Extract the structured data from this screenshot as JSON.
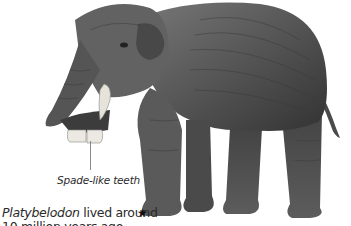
{
  "illustration": {
    "subject": "Platybelodon",
    "body_color": "#5a5a5a",
    "shadow_color": "#2e2e2e",
    "tooth_color": "#e8e6df",
    "background": "#ffffff"
  },
  "labels": {
    "teeth": "Spade-like teeth"
  },
  "caption": {
    "name": "Platybelodon",
    "line1_rest": " lived around",
    "line2": "10 million years ago"
  },
  "icons": {
    "star": "★"
  }
}
